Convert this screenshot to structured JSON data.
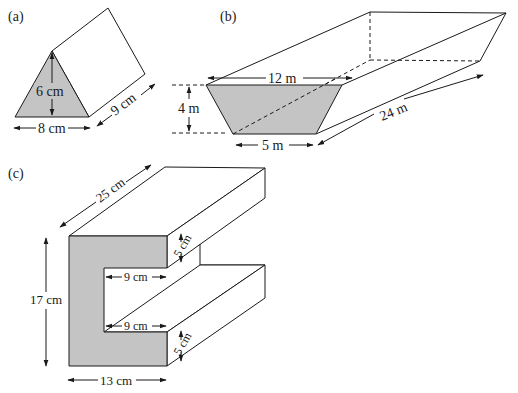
{
  "colors": {
    "shade": "#c4c4c4",
    "line": "#1a1a1a",
    "background": "#ffffff"
  },
  "figures": {
    "a": {
      "label": "(a)",
      "shape": "triangular prism",
      "height_label": "6 cm",
      "base_label": "8 cm",
      "length_label": "9 cm"
    },
    "b": {
      "label": "(b)",
      "shape": "trapezoidal prism (trough)",
      "top_label": "12 m",
      "depth_label": "4 m",
      "bottom_label": "5 m",
      "length_label": "24 m"
    },
    "c": {
      "label": "(c)",
      "shape": "C-shaped prism",
      "length_label": "25 cm",
      "height_label": "17 cm",
      "width_label": "13 cm",
      "top_flange_label": "5 cm",
      "bottom_flange_label": "5 cm",
      "gap_top_label": "9 cm",
      "gap_bottom_label": "9 cm"
    }
  }
}
